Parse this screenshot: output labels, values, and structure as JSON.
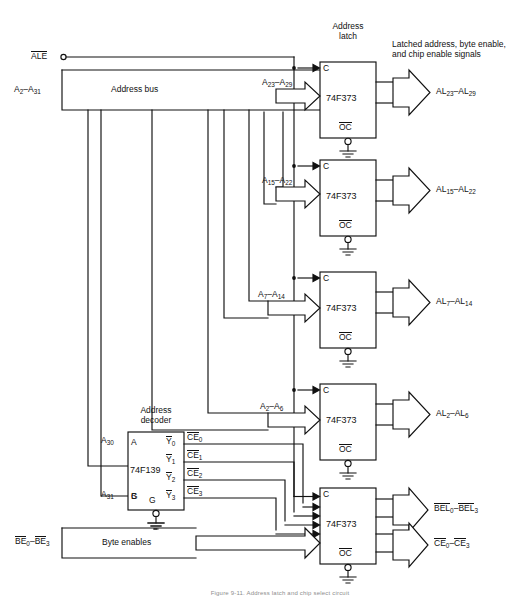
{
  "figure": {
    "caption": "Figure 9-11. Address latch and chip select circuit"
  },
  "signals": {
    "ale": {
      "label": "ALE",
      "overbar": true,
      "name": "address-latch-enable"
    },
    "address_bus": {
      "label": "Address bus",
      "range": "A",
      "from": "2",
      "to": "31"
    },
    "byte_enables": {
      "label": "Byte enables",
      "range": "BE",
      "from": "0",
      "to": "3",
      "overbar": true
    },
    "latched_note": {
      "line1": "Latched address, byte enable,",
      "line2": "and chip enable signals"
    }
  },
  "blocks": {
    "address_latch_title": {
      "line1": "Address",
      "line2": "latch"
    },
    "address_decoder_title": {
      "line1": "Address",
      "line2": "decoder"
    },
    "latch_part": "74F373",
    "decoder_part": "74F139",
    "clock_pin": "C",
    "oc_pin": "OC",
    "decoder_pins": {
      "a": "A",
      "b": "B",
      "g": "G"
    },
    "decoder_outputs": [
      "Y",
      "Y",
      "Y",
      "Y"
    ],
    "decoder_output_index": [
      "0",
      "1",
      "2",
      "3"
    ]
  },
  "latches": [
    {
      "id": "latch-1",
      "part": "74F373",
      "in_base": "A",
      "in_from": "23",
      "in_to": "29",
      "out_base": "AL",
      "out_from": "23",
      "out_to": "29",
      "clock": "C",
      "oc": "OC"
    },
    {
      "id": "latch-2",
      "part": "74F373",
      "in_base": "A",
      "in_from": "15",
      "in_to": "22",
      "out_base": "AL",
      "out_from": "15",
      "out_to": "22",
      "clock": "C",
      "oc": "OC"
    },
    {
      "id": "latch-3",
      "part": "74F373",
      "in_base": "A",
      "in_from": "7",
      "in_to": "14",
      "out_base": "AL",
      "out_from": "7",
      "out_to": "14",
      "clock": "C",
      "oc": "OC"
    },
    {
      "id": "latch-4",
      "part": "74F373",
      "in_base": "A",
      "in_from": "2",
      "in_to": "6",
      "out_base": "AL",
      "out_from": "2",
      "out_to": "6",
      "clock": "C",
      "oc": "OC"
    },
    {
      "id": "latch-5",
      "part": "74F373",
      "in_base": "",
      "in_from": "",
      "in_to": "",
      "out_base": "BEL",
      "out_from": "0",
      "out_to": "3",
      "clock": "C",
      "oc": "OC"
    }
  ],
  "decoder": {
    "part": "74F139",
    "input_a": {
      "base": "A",
      "index": "30"
    },
    "input_b": {
      "base": "A",
      "index": "31"
    },
    "gate": "G",
    "outputs": [
      {
        "pin": "Y",
        "pin_index": "0",
        "net": "CE",
        "net_index": "0",
        "overbar": true
      },
      {
        "pin": "Y",
        "pin_index": "1",
        "net": "CE",
        "net_index": "1",
        "overbar": true
      },
      {
        "pin": "Y",
        "pin_index": "2",
        "net": "CE",
        "net_index": "2",
        "overbar": true
      },
      {
        "pin": "Y",
        "pin_index": "3",
        "net": "CE",
        "net_index": "3",
        "overbar": true
      }
    ]
  },
  "outputs": [
    {
      "base": "AL",
      "from": "23",
      "to": "29",
      "overbar": false
    },
    {
      "base": "AL",
      "from": "15",
      "to": "22",
      "overbar": false
    },
    {
      "base": "AL",
      "from": "7",
      "to": "14",
      "overbar": false
    },
    {
      "base": "AL",
      "from": "2",
      "to": "6",
      "overbar": false
    },
    {
      "base": "BEL",
      "from": "0",
      "to": "3",
      "overbar": true
    },
    {
      "base": "CE",
      "from": "0",
      "to": "3",
      "overbar": true
    }
  ],
  "colors": {
    "ink": "#111111",
    "paper": "#ffffff",
    "caption": "#8d8d8d"
  }
}
